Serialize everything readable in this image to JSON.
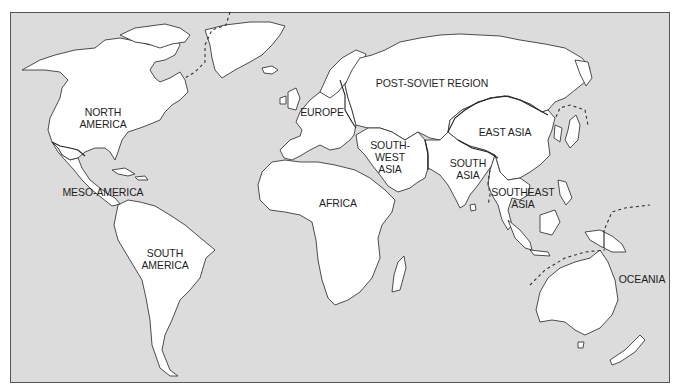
{
  "map": {
    "title": "World regions",
    "background_color": "#dcdcdc",
    "land_color": "#ffffff",
    "outline_color": "#3a3a3a",
    "regions": [
      {
        "id": "north-america",
        "label": "NORTH\nAMERICA"
      },
      {
        "id": "meso-america",
        "label": "MESO-AMERICA"
      },
      {
        "id": "south-america",
        "label": "SOUTH\nAMERICA"
      },
      {
        "id": "europe",
        "label": "EUROPE"
      },
      {
        "id": "post-soviet",
        "label": "POST-SOVIET REGION"
      },
      {
        "id": "africa",
        "label": "AFRICA"
      },
      {
        "id": "southwest-asia",
        "label": "SOUTH-\nWEST\nASIA"
      },
      {
        "id": "south-asia",
        "label": "SOUTH\nASIA"
      },
      {
        "id": "east-asia",
        "label": "EAST ASIA"
      },
      {
        "id": "southeast-asia",
        "label": "SOUTHEAST\nASIA"
      },
      {
        "id": "oceania",
        "label": "OCEANIA"
      }
    ]
  }
}
